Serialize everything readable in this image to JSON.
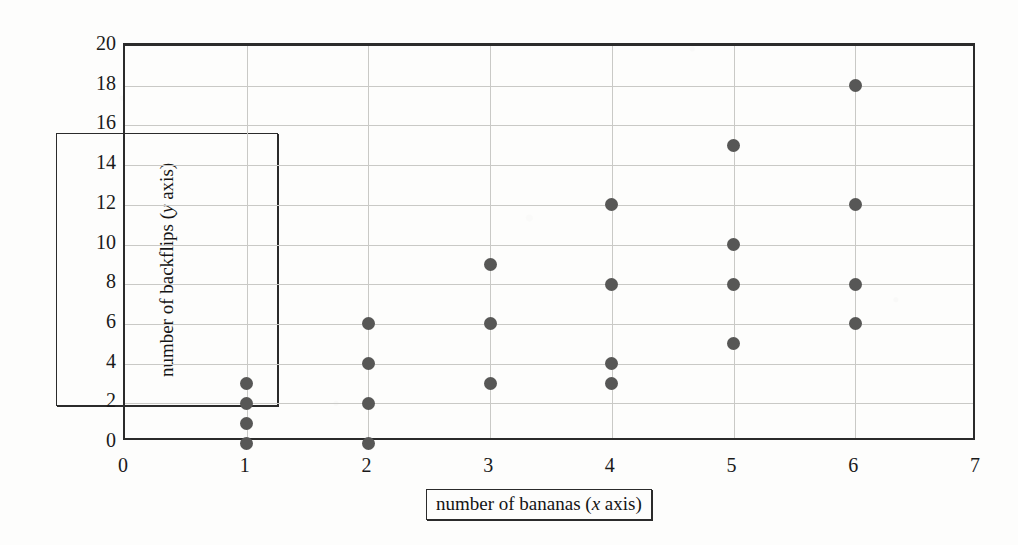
{
  "chart_data": {
    "type": "scatter",
    "title": "",
    "xlabel": "number of bananas (x axis)",
    "ylabel": "number of backflips (y axis)",
    "xlabel_parts": {
      "lead": "number of bananas (",
      "italic": "x",
      "trail": " axis)"
    },
    "ylabel_parts": {
      "lead": "number of backflips (",
      "italic": "y",
      "trail": " axis)"
    },
    "xlim": [
      0,
      7
    ],
    "ylim": [
      0,
      20
    ],
    "xticks": [
      0,
      1,
      2,
      3,
      4,
      5,
      6,
      7
    ],
    "yticks": [
      0,
      2,
      4,
      6,
      8,
      10,
      12,
      14,
      16,
      18,
      20
    ],
    "grid": true,
    "grid_x_values": [
      1,
      2,
      3,
      4,
      5,
      6
    ],
    "grid_y_values": [
      2,
      4,
      6,
      8,
      10,
      12,
      14,
      16,
      18
    ],
    "legend": null,
    "marker": {
      "shape": "circle",
      "color": "#575756",
      "size_px": 13
    },
    "points": [
      {
        "x": 1,
        "y": 0
      },
      {
        "x": 1,
        "y": 1
      },
      {
        "x": 1,
        "y": 2
      },
      {
        "x": 1,
        "y": 3
      },
      {
        "x": 2,
        "y": 0
      },
      {
        "x": 2,
        "y": 2
      },
      {
        "x": 2,
        "y": 4
      },
      {
        "x": 2,
        "y": 6
      },
      {
        "x": 3,
        "y": 3
      },
      {
        "x": 3,
        "y": 6
      },
      {
        "x": 3,
        "y": 9
      },
      {
        "x": 4,
        "y": 3
      },
      {
        "x": 4,
        "y": 4
      },
      {
        "x": 4,
        "y": 8
      },
      {
        "x": 4,
        "y": 12
      },
      {
        "x": 5,
        "y": 5
      },
      {
        "x": 5,
        "y": 8
      },
      {
        "x": 5,
        "y": 10
      },
      {
        "x": 5,
        "y": 15
      },
      {
        "x": 6,
        "y": 6
      },
      {
        "x": 6,
        "y": 8
      },
      {
        "x": 6,
        "y": 12
      },
      {
        "x": 6,
        "y": 18
      }
    ]
  },
  "colors": {
    "marker": "#575756",
    "axis": "#2b2b2b",
    "grid": "#c9c9c6",
    "text": "#141414",
    "paper": "#fdfdfc"
  }
}
